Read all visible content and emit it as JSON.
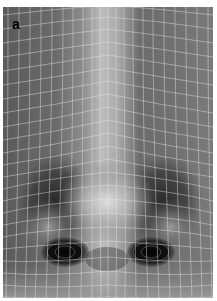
{
  "figure": {
    "panel_label": "a",
    "colors": {
      "background": "#ffffff",
      "skin_mid": "#7a7a7a",
      "highlight": "#d8d8d8",
      "shadow": "#1a1a1a",
      "grid": "#e6e6e6"
    }
  }
}
